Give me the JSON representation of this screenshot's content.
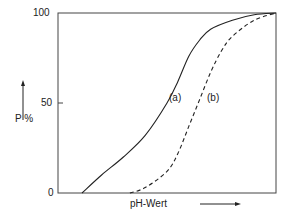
{
  "chart_data": {
    "type": "line",
    "title": "",
    "xlabel": "pH-Wert",
    "ylabel": "P %",
    "ylim": [
      0,
      100
    ],
    "yticks": [
      "0",
      "50",
      "100"
    ],
    "grid": false,
    "legend": "inline labels",
    "series": [
      {
        "name": "(a)",
        "style": "solid",
        "x": [
          0.11,
          0.2,
          0.3,
          0.4,
          0.5,
          0.55,
          0.6,
          0.65,
          0.7,
          0.8,
          0.9,
          1.0
        ],
        "values": [
          0,
          10,
          20,
          32,
          50,
          62,
          76,
          85,
          91,
          96,
          99,
          100
        ]
      },
      {
        "name": "(b)",
        "style": "dashed",
        "x": [
          0.33,
          0.4,
          0.5,
          0.55,
          0.6,
          0.65,
          0.7,
          0.75,
          0.8,
          0.9,
          1.0
        ],
        "values": [
          0,
          3,
          12,
          22,
          37,
          52,
          67,
          79,
          87,
          96,
          100
        ]
      }
    ]
  },
  "labels": {
    "y100": "100",
    "y50": "50",
    "y0": "0",
    "ylabel": "P %",
    "xlabel": "pH-Wert",
    "series_a": "(a)",
    "series_b": "(b)"
  }
}
